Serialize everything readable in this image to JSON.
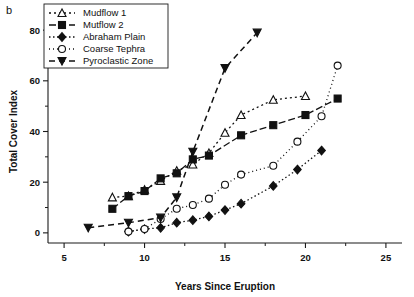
{
  "panel_label": "b",
  "chart_data": {
    "type": "line",
    "title": "",
    "xlabel": "Years Since Eruption",
    "ylabel": "Total Cover Index",
    "xlim": [
      4,
      26
    ],
    "ylim": [
      -4,
      84
    ],
    "xticks": [
      5,
      10,
      15,
      20,
      25
    ],
    "yticks": [
      0,
      20,
      40,
      60,
      80
    ],
    "xticks_minor": [
      7.5,
      12.5,
      17.5,
      22.5
    ],
    "yticks_minor": [
      10,
      30,
      50,
      70
    ],
    "grid": false,
    "legend_position": "top-left",
    "series": [
      {
        "name": "Mudflow 1",
        "marker": "open-triangle-up",
        "dash": "2,3",
        "x": [
          8.0,
          9.0,
          10.0,
          11.0,
          12.0,
          13.0,
          14.0,
          15.0,
          16.0,
          18.0,
          20.0
        ],
        "y": [
          14.0,
          14.5,
          17.0,
          20.5,
          24.5,
          27.0,
          31.5,
          39.5,
          46.5,
          52.5,
          54.0
        ]
      },
      {
        "name": "Mutflow 2",
        "marker": "filled-square",
        "dash": "7,3",
        "x": [
          8.0,
          9.0,
          10.0,
          11.0,
          12.0,
          13.0,
          14.0,
          16.0,
          18.0,
          20.0,
          22.0
        ],
        "y": [
          9.5,
          14.5,
          16.5,
          21.5,
          23.5,
          29.0,
          30.5,
          38.5,
          42.5,
          46.5,
          53.0
        ]
      },
      {
        "name": "Abraham Plain",
        "marker": "filled-diamond",
        "dash": "1.5,2.5",
        "x": [
          9.0,
          10.0,
          11.0,
          12.0,
          13.0,
          14.0,
          15.0,
          16.0,
          18.0,
          19.5,
          21.0
        ],
        "y": [
          0.5,
          1.5,
          2.0,
          4.0,
          5.0,
          6.5,
          9.0,
          11.5,
          18.5,
          25.0,
          32.5
        ]
      },
      {
        "name": "Coarse Tephra",
        "marker": "open-circle",
        "dash": "1,3",
        "x": [
          9.0,
          10.0,
          11.0,
          12.0,
          13.0,
          14.0,
          15.0,
          16.0,
          18.0,
          19.5,
          21.0,
          22.0
        ],
        "y": [
          0.5,
          1.5,
          5.5,
          9.5,
          11.0,
          13.5,
          19.0,
          23.0,
          26.5,
          36.0,
          46.0,
          66.0
        ]
      },
      {
        "name": "Pyroclastic Zone",
        "marker": "filled-triangle-down",
        "dash": "6,4",
        "x": [
          6.5,
          9.0,
          11.0,
          12.0,
          13.0,
          15.0,
          17.0
        ],
        "y": [
          2.0,
          4.0,
          6.0,
          14.0,
          32.0,
          65.0,
          79.0
        ]
      }
    ]
  }
}
